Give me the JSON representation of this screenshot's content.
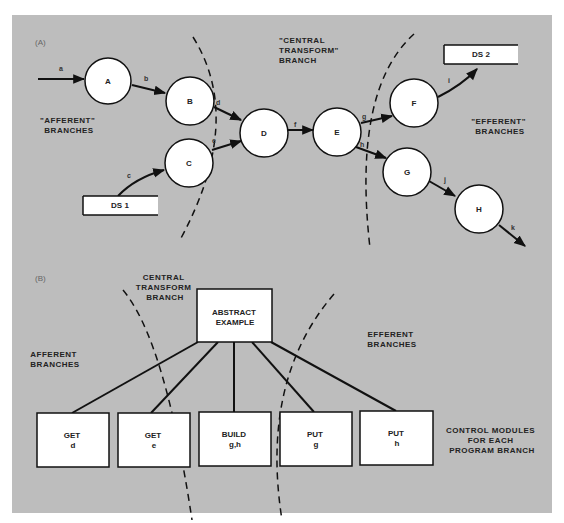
{
  "colors": {
    "panel_background": "#bdbdbd",
    "node_fill": "#ffffff",
    "stroke": "#111111"
  },
  "part_a": {
    "section_label": "(A)",
    "regions": {
      "afferent": [
        "\"AFFERENT\"",
        "BRANCHES"
      ],
      "central": [
        "\"CENTRAL",
        "TRANSFORM\"",
        "BRANCH"
      ],
      "efferent": [
        "\"EFFERENT\"",
        "BRANCHES"
      ]
    },
    "nodes": [
      {
        "id": "A",
        "label": "A"
      },
      {
        "id": "B",
        "label": "B"
      },
      {
        "id": "C",
        "label": "C"
      },
      {
        "id": "D",
        "label": "D"
      },
      {
        "id": "E",
        "label": "E"
      },
      {
        "id": "F",
        "label": "F"
      },
      {
        "id": "G",
        "label": "G"
      },
      {
        "id": "H",
        "label": "H"
      }
    ],
    "data_stores": [
      {
        "id": "DS1",
        "label": "DS 1"
      },
      {
        "id": "DS2",
        "label": "DS 2"
      }
    ],
    "edges": [
      {
        "label": "a",
        "from": "input",
        "to": "A"
      },
      {
        "label": "b",
        "from": "A",
        "to": "B"
      },
      {
        "label": "c",
        "from": "DS1",
        "to": "C"
      },
      {
        "label": "d",
        "from": "B",
        "to": "D"
      },
      {
        "label": "e",
        "from": "C",
        "to": "D"
      },
      {
        "label": "f",
        "from": "D",
        "to": "E"
      },
      {
        "label": "g",
        "from": "E",
        "to": "F"
      },
      {
        "label": "h",
        "from": "E",
        "to": "G"
      },
      {
        "label": "i",
        "from": "F",
        "to": "DS2"
      },
      {
        "label": "j",
        "from": "G",
        "to": "H"
      },
      {
        "label": "k",
        "from": "H",
        "to": "output"
      }
    ]
  },
  "part_b": {
    "section_label": "(B)",
    "regions": {
      "afferent": [
        "AFFERENT",
        "BRANCHES"
      ],
      "central": [
        "CENTRAL",
        "TRANSFORM",
        "BRANCH"
      ],
      "efferent": [
        "EFFERENT",
        "BRANCHES"
      ]
    },
    "root": {
      "lines": [
        "ABSTRACT",
        "EXAMPLE"
      ]
    },
    "modules": [
      {
        "lines": [
          "GET",
          "d"
        ]
      },
      {
        "lines": [
          "GET",
          "e"
        ]
      },
      {
        "lines": [
          "BUILD",
          "g,h"
        ]
      },
      {
        "lines": [
          "PUT",
          "g"
        ]
      },
      {
        "lines": [
          "PUT",
          "h"
        ]
      }
    ],
    "caption": [
      "CONTROL MODULES",
      "FOR EACH",
      "PROGRAM BRANCH"
    ]
  }
}
